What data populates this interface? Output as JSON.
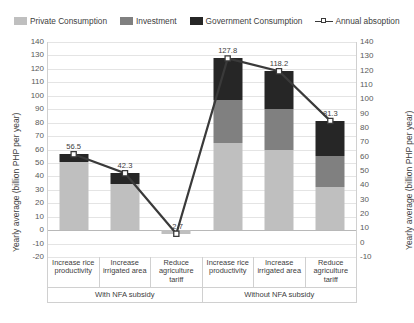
{
  "chart_data": {
    "type": "bar",
    "title": "",
    "subtitle": "",
    "xlabel": "",
    "ylabel": "Yearly average (billion PHP per year)",
    "ylabel_right": "Yearly average (billion PHP per year)",
    "ylim": [
      -20,
      140
    ],
    "ylim_right": [
      -10,
      140
    ],
    "yticks": [
      140,
      130,
      120,
      110,
      100,
      90,
      80,
      70,
      60,
      50,
      40,
      30,
      20,
      10,
      0,
      -10,
      -20
    ],
    "yticks_right": [
      140,
      130,
      120,
      110,
      100,
      90,
      80,
      70,
      60,
      50,
      40,
      30,
      20,
      10,
      0,
      -10
    ],
    "grid": true,
    "legend_position": "top",
    "stacked": true,
    "categories": [
      "Increase rice productivity",
      "Increase irrigated area",
      "Reduce agriculture tariff",
      "Increase rice productivity",
      "Increase irrigated area",
      "Reduce agriculture tariff"
    ],
    "groups": [
      {
        "label": "With NFA subsidy",
        "span": 3
      },
      {
        "label": "Without NFA subsidy",
        "span": 3
      }
    ],
    "series": [
      {
        "name": "Private Consumption",
        "type": "bar",
        "color": "#bfbfbf",
        "values": [
          51.0,
          34.0,
          -2.7,
          64.5,
          60.0,
          32.0
        ]
      },
      {
        "name": "Investment",
        "type": "bar",
        "color": "#808080",
        "values": [
          0.0,
          0.0,
          0.0,
          32.0,
          30.0,
          23.0
        ]
      },
      {
        "name": "Government Consumption",
        "type": "bar",
        "color": "#262626",
        "values": [
          5.5,
          8.3,
          0.0,
          31.3,
          28.2,
          26.3
        ]
      },
      {
        "name": "Annual absoption",
        "type": "line",
        "color": "#3a3a3a",
        "marker": "white-square",
        "values": [
          56.5,
          42.3,
          -2.7,
          127.8,
          118.2,
          81.3
        ]
      }
    ],
    "data_labels": [
      "56.5",
      "42.3",
      "-2.7",
      "127.8",
      "118.2",
      "81.3"
    ]
  },
  "legend": {
    "items": [
      {
        "label": "Private Consumption",
        "swatch": "legend-swatch-private",
        "color": "#bfbfbf"
      },
      {
        "label": "Investment",
        "swatch": "legend-swatch-investment",
        "color": "#808080"
      },
      {
        "label": "Government Consumption",
        "swatch": "legend-swatch-government",
        "color": "#262626"
      },
      {
        "label": "Annual absoption",
        "swatch": "legend-marker-line",
        "color": "#3a3a3a"
      }
    ]
  }
}
